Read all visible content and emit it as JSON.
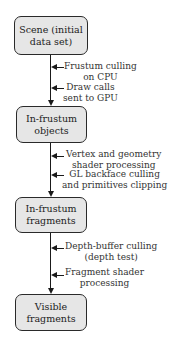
{
  "diagram": {
    "type": "flowchart",
    "direction": "top-to-bottom",
    "nodes": [
      {
        "id": "scene",
        "line1": "Scene (initial",
        "line2": "data set)"
      },
      {
        "id": "in_frustum_objects",
        "line1": "In-frustum",
        "line2": "objects"
      },
      {
        "id": "in_frustum_fragments",
        "line1": "In-frustum",
        "line2": "fragments"
      },
      {
        "id": "visible_fragments",
        "line1": "Visible",
        "line2": "fragments"
      }
    ],
    "edges": [
      {
        "from": "scene",
        "to": "in_frustum_objects",
        "steps": [
          {
            "line1": "Frustum culling",
            "line2": "on CPU"
          },
          {
            "line1": "Draw calls",
            "line2": "sent to GPU"
          }
        ]
      },
      {
        "from": "in_frustum_objects",
        "to": "in_frustum_fragments",
        "steps": [
          {
            "line1": "Vertex and geometry",
            "line2": "shader processing"
          },
          {
            "line1": "GL backface culling",
            "line2": "and primitives clipping"
          }
        ]
      },
      {
        "from": "in_frustum_fragments",
        "to": "visible_fragments",
        "steps": [
          {
            "line1": "Depth-buffer culling",
            "line2": "(depth test)"
          },
          {
            "line1": "Fragment shader",
            "line2": "processing"
          }
        ]
      }
    ],
    "colors": {
      "box_fill": "#e6e6e6",
      "box_border": "#2a2a2a",
      "arrow": "#1a1a1a",
      "text": "#222222"
    }
  }
}
